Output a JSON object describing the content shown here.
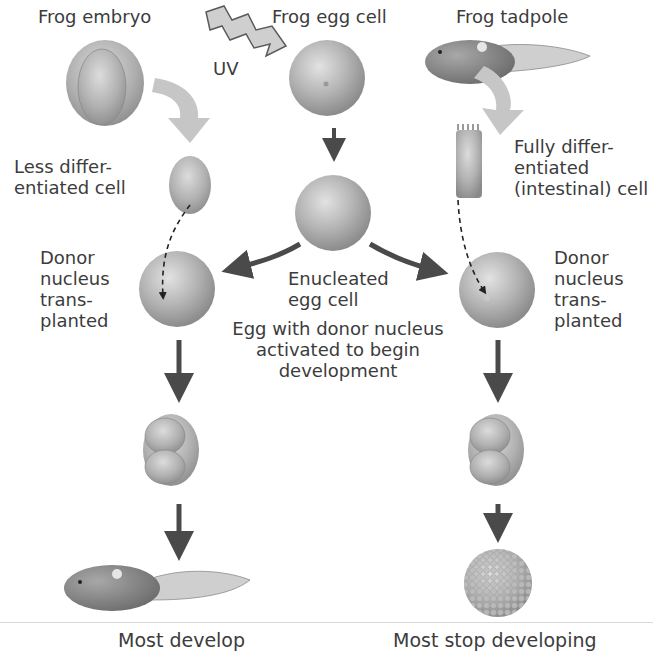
{
  "diagram": {
    "title_labels": {
      "frog_embryo": "Frog embryo",
      "frog_egg_cell": "Frog egg cell",
      "frog_tadpole": "Frog tadpole",
      "uv": "UV"
    },
    "left_branch": {
      "donor_cell": "Less differ-\nentiated cell",
      "transplant": "Donor\nnucleus\ntrans-\nplanted",
      "outcome": "Most develop"
    },
    "right_branch": {
      "donor_cell": "Fully differ-\nentiated\n(intestinal) cell",
      "transplant": "Donor\nnucleus\ntrans-\nplanted",
      "outcome": "Most stop developing"
    },
    "center": {
      "enucleated": "Enucleated\negg cell",
      "activated": "Egg with donor nucleus\nactivated to begin\ndevelopment"
    },
    "colors": {
      "cell_fill": "#b9b9b9",
      "cell_shadow": "#8f8f8f",
      "arrow_dark": "#4a4a4a",
      "arrow_light": "#c4c4c4",
      "text": "#3c3c3c"
    }
  }
}
